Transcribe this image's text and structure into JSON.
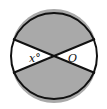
{
  "diagram": {
    "type": "circle-with-two-diameters",
    "center_label": "O",
    "angle_label": "x°",
    "colors": {
      "shaded": "#a9a9a9",
      "unshaded": "#ffffff",
      "stroke": "#111111"
    }
  }
}
